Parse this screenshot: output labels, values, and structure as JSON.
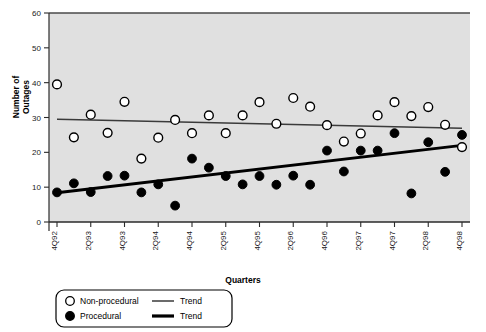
{
  "chart_data": {
    "type": "scatter",
    "title": "",
    "xlabel": "Quarters",
    "ylabel": "Number of Outages",
    "ylabel_line1": "Number of",
    "ylabel_line2": "Outages",
    "ylim": [
      0,
      60
    ],
    "yticks": [
      0,
      10,
      20,
      30,
      40,
      50,
      60
    ],
    "ytick_labels": [
      "0",
      "10",
      "20",
      "30",
      "40",
      "50",
      "60"
    ],
    "grid": false,
    "plot_background": "#e0e0e0",
    "legend_position": "below-left",
    "x_index": [
      0,
      1,
      2,
      3,
      4,
      5,
      6,
      7,
      8,
      9,
      10,
      11,
      12,
      13,
      14,
      15,
      16,
      17,
      18,
      19,
      20,
      21,
      22,
      23,
      24
    ],
    "xtick_labels": [
      "4Q92",
      "2Q93",
      "4Q93",
      "2Q94",
      "4Q94",
      "2Q95",
      "4Q95",
      "2Q96",
      "4Q96",
      "2Q97",
      "4Q97",
      "2Q98",
      "4Q98"
    ],
    "xtick_index": [
      0,
      2,
      4,
      6,
      8,
      10,
      12,
      14,
      16,
      18,
      20,
      22,
      24
    ],
    "series": [
      {
        "name": "Non-procedural",
        "marker": "open-circle",
        "color": "#ffffff",
        "edge_color": "#000000",
        "values": [
          39.5,
          24.3,
          30.8,
          25.6,
          34.5,
          18.2,
          24.2,
          29.3,
          25.5,
          30.6,
          25.5,
          30.6,
          34.4,
          28.2,
          35.6,
          33.1,
          27.8,
          23.1,
          25.4,
          30.6,
          34.4,
          30.4,
          33.0,
          27.9,
          21.5
        ]
      },
      {
        "name": "Procedural",
        "marker": "filled-circle",
        "color": "#000000",
        "edge_color": "#000000",
        "values": [
          8.5,
          11.1,
          8.6,
          13.2,
          13.3,
          8.5,
          10.8,
          4.7,
          18.2,
          15.6,
          13.2,
          10.8,
          13.2,
          10.7,
          13.3,
          10.7,
          20.5,
          14.5,
          20.5,
          20.5,
          25.5,
          8.2,
          22.9,
          14.4,
          25.0
        ]
      }
    ],
    "trends": [
      {
        "name": "Trend",
        "of_series": "Non-procedural",
        "style": "thin",
        "color": "#3a3a3a",
        "width_px": 1.4,
        "y_start": 29.5,
        "y_end": 26.9
      },
      {
        "name": "Trend",
        "of_series": "Procedural",
        "style": "thick",
        "color": "#000000",
        "width_px": 3.0,
        "y_start": 8.4,
        "y_end": 22.0
      }
    ]
  },
  "legend": {
    "entries": [
      {
        "marker": "open-circle",
        "label": "Non-procedural",
        "line": "thin",
        "line_label": "Trend"
      },
      {
        "marker": "filled-circle",
        "label": "Procedural",
        "line": "thick",
        "line_label": "Trend"
      }
    ]
  }
}
